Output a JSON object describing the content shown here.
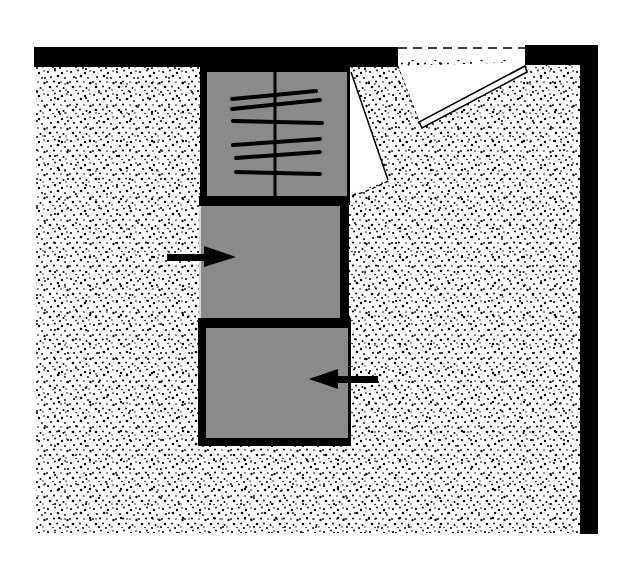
{
  "diagram": {
    "type": "floor-plan",
    "colors": {
      "background": "#ffffff",
      "wall": "#000000",
      "floor_dots": "#000000",
      "cabinet_fill": "#8a8a8a",
      "door_swing": "#ffffff"
    },
    "elements": {
      "top_wall": {
        "label": "Top wall"
      },
      "right_wall": {
        "label": "Right wall"
      },
      "door_opening": {
        "label": "Doorway (dashed line)"
      },
      "room_door": {
        "label": "Room door, swung open"
      },
      "wardrobe": {
        "label": "Wardrobe with hanging rod",
        "hanger_count": 6
      },
      "wardrobe_door": {
        "label": "Wardrobe door swing"
      },
      "middle_unit": {
        "label": "Middle storage unit (accessed from left)"
      },
      "bottom_unit": {
        "label": "Bottom storage unit (accessed from right)"
      },
      "arrow_left_side": {
        "label": "Access arrow pointing right"
      },
      "arrow_right_side": {
        "label": "Access arrow pointing left"
      }
    }
  }
}
